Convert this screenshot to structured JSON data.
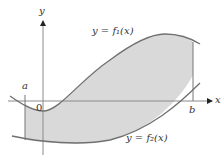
{
  "diagram": {
    "type": "area-between-curves",
    "axes": {
      "x_label": "x",
      "y_label": "y",
      "origin_label": "0"
    },
    "curves": [
      {
        "name": "f1",
        "label": "y = f₁(x)"
      },
      {
        "name": "f2",
        "label": "y = f₂(x)"
      }
    ],
    "bounds": {
      "a": "a",
      "b": "b"
    },
    "colors": {
      "shade": "#d9d9d9",
      "curve": "#707070",
      "axis": "#8a8a8a"
    }
  }
}
